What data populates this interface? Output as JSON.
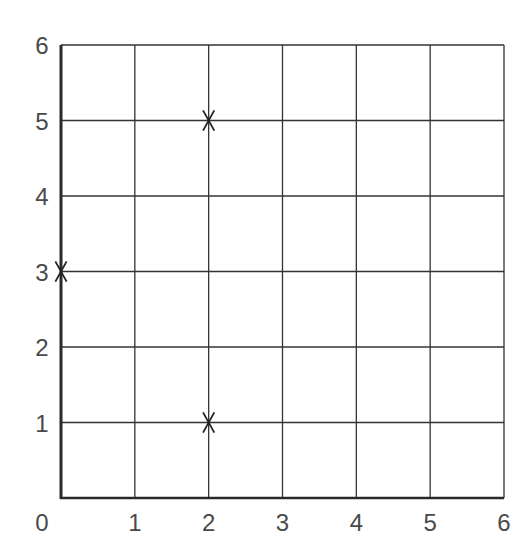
{
  "chart_data": {
    "type": "scatter",
    "title": "",
    "xlabel": "",
    "ylabel": "",
    "xlim": [
      0,
      6
    ],
    "ylim": [
      0,
      6
    ],
    "grid": true,
    "legend": null,
    "x_ticks": [
      "0",
      "1",
      "2",
      "3",
      "4",
      "5",
      "6"
    ],
    "y_ticks": [
      "1",
      "2",
      "3",
      "4",
      "5",
      "6"
    ],
    "marker": "x",
    "series": [
      {
        "name": "points",
        "points": [
          {
            "x": 2,
            "y": 5
          },
          {
            "x": 0,
            "y": 3
          },
          {
            "x": 2,
            "y": 1
          }
        ]
      }
    ]
  },
  "colors": {
    "grid": "#333333",
    "axis": "#2a2a2a",
    "marker": "#222222",
    "label": "#4a4a4a"
  }
}
